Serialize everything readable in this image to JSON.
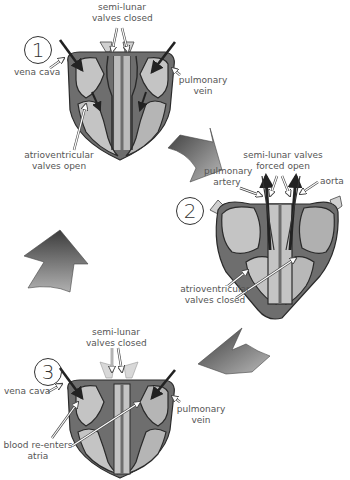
{
  "diagram": {
    "type": "cardiac-cycle",
    "colors": {
      "muscle": "#6e6e6e",
      "outline": "#2a2a2a",
      "chamber_light": "#c4c4c4",
      "chamber_mid": "#a9a9a9",
      "label_text": "#555555"
    },
    "stages": [
      {
        "number": "1",
        "labels": {
          "top": [
            "semi-lunar",
            "valves closed"
          ],
          "left": "vena cava",
          "right": [
            "pulmonary",
            "vein"
          ],
          "bottom": [
            "atrioventricular",
            "valves open"
          ]
        }
      },
      {
        "number": "2",
        "labels": {
          "top": [
            "semi-lunar valves",
            "forced open"
          ],
          "left": [
            "pulmonary",
            "artery"
          ],
          "right": "aorta",
          "bottom": [
            "atrioventricular",
            "valves closed"
          ]
        }
      },
      {
        "number": "3",
        "labels": {
          "top": [
            "semi-lunar",
            "valves closed"
          ],
          "left": "vena cava",
          "right": [
            "pulmonary",
            "vein"
          ],
          "bottom": [
            "blood re-enters",
            "atria"
          ]
        }
      }
    ],
    "cycle_arrows": [
      "stage1-to-stage2",
      "stage2-to-stage3",
      "stage3-to-stage1"
    ]
  }
}
